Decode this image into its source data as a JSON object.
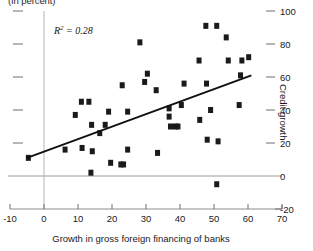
{
  "chart_data": {
    "type": "scatter",
    "title": "",
    "unit_note": "(In percent)",
    "xlabel": "Growth in gross foreign financing of banks",
    "ylabel": "Credit growth",
    "xlim": [
      -10,
      70
    ],
    "ylim": [
      -20,
      100
    ],
    "xticks": [
      -10,
      0,
      10,
      20,
      30,
      40,
      50,
      60,
      70
    ],
    "xtick_labels": [
      "-10",
      "0",
      "10",
      "20",
      "30",
      "40",
      "50",
      "60",
      "70"
    ],
    "yticks": [
      -20,
      0,
      20,
      40,
      60,
      80,
      100
    ],
    "ytick_labels": [
      "-20",
      "0",
      "20",
      "40",
      "60",
      "80",
      "100"
    ],
    "ytick_side": "right",
    "left_ticks_unlabeled": [
      20,
      40,
      60,
      80,
      100
    ],
    "grid": false,
    "zero_line": true,
    "annotations": [
      {
        "text": "R2 = 0.28",
        "r2_value": 0.28,
        "x": 8,
        "y": 90
      }
    ],
    "trendline": {
      "type": "linear",
      "x_start": -5,
      "y_start": 11,
      "x_end": 61,
      "y_end": 61
    },
    "marker": {
      "shape": "square",
      "color": "#1a1a1a",
      "size": 5
    },
    "points": [
      {
        "x": -4.6,
        "y": 11
      },
      {
        "x": 6.2,
        "y": 16
      },
      {
        "x": 9.2,
        "y": 37
      },
      {
        "x": 11.0,
        "y": 45
      },
      {
        "x": 11.2,
        "y": 17
      },
      {
        "x": 13.2,
        "y": 45
      },
      {
        "x": 13.8,
        "y": 2
      },
      {
        "x": 14.0,
        "y": 31
      },
      {
        "x": 14.2,
        "y": 15
      },
      {
        "x": 16.4,
        "y": 26
      },
      {
        "x": 18.0,
        "y": 31
      },
      {
        "x": 19.0,
        "y": 39
      },
      {
        "x": 19.6,
        "y": 8
      },
      {
        "x": 22.6,
        "y": 7
      },
      {
        "x": 23.4,
        "y": 7
      },
      {
        "x": 23.0,
        "y": 55
      },
      {
        "x": 24.6,
        "y": 39
      },
      {
        "x": 24.6,
        "y": 16
      },
      {
        "x": 28.2,
        "y": 81
      },
      {
        "x": 29.6,
        "y": 57
      },
      {
        "x": 30.4,
        "y": 62
      },
      {
        "x": 33.0,
        "y": 52
      },
      {
        "x": 33.4,
        "y": 14
      },
      {
        "x": 36.8,
        "y": 41
      },
      {
        "x": 36.8,
        "y": 36
      },
      {
        "x": 37.2,
        "y": 30
      },
      {
        "x": 38.6,
        "y": 30
      },
      {
        "x": 39.4,
        "y": 30
      },
      {
        "x": 40.4,
        "y": 43
      },
      {
        "x": 41.2,
        "y": 56
      },
      {
        "x": 45.6,
        "y": 70
      },
      {
        "x": 45.8,
        "y": 34
      },
      {
        "x": 47.6,
        "y": 91
      },
      {
        "x": 47.8,
        "y": 56
      },
      {
        "x": 48.0,
        "y": 22
      },
      {
        "x": 49.0,
        "y": 40
      },
      {
        "x": 50.8,
        "y": 91
      },
      {
        "x": 50.8,
        "y": -5
      },
      {
        "x": 51.2,
        "y": 21
      },
      {
        "x": 53.6,
        "y": 84
      },
      {
        "x": 54.2,
        "y": 70
      },
      {
        "x": 57.4,
        "y": 43
      },
      {
        "x": 57.8,
        "y": 61
      },
      {
        "x": 58.2,
        "y": 70
      },
      {
        "x": 60.2,
        "y": 72
      }
    ]
  }
}
